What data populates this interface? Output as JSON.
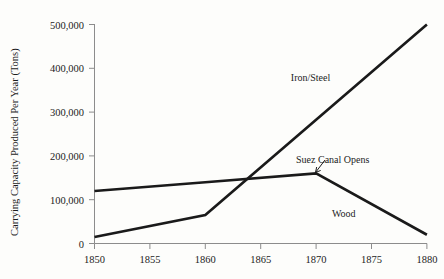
{
  "chart_data": {
    "type": "line",
    "title": "",
    "xlabel": "",
    "ylabel": "Carrying Capacity Produced Per Year (Tons)",
    "x": [
      1850,
      1855,
      1860,
      1865,
      1870,
      1875,
      1880
    ],
    "xlim": [
      1850,
      1880
    ],
    "ylim": [
      0,
      500000
    ],
    "grid": false,
    "legend_position": "inline-labels",
    "xticks": [
      "1850",
      "1855",
      "1860",
      "1865",
      "1870",
      "1875",
      "1880"
    ],
    "yticks": [
      "0",
      "100,000",
      "200,000",
      "300,000",
      "400,000",
      "500,000"
    ],
    "ytick_values": [
      0,
      100000,
      200000,
      300000,
      400000,
      500000
    ],
    "series": [
      {
        "name": "Wood",
        "x": [
          1850,
          1860,
          1870,
          1880
        ],
        "values": [
          120000,
          140000,
          160000,
          20000
        ],
        "color": "#1a1a1a"
      },
      {
        "name": "Iron/Steel",
        "x": [
          1850,
          1860,
          1880
        ],
        "values": [
          15000,
          65000,
          500000
        ],
        "color": "#1a1a1a"
      }
    ],
    "annotations": [
      {
        "text": "Iron/Steel",
        "x": 1869.5,
        "y": 370000,
        "kind": "series-label"
      },
      {
        "text": "Wood",
        "x": 1872.5,
        "y": 60000,
        "kind": "series-label"
      },
      {
        "text": "Suez Canal Opens",
        "x": 1871.5,
        "y": 183000,
        "kind": "callout",
        "points_to": {
          "x": 1870,
          "y": 160000
        }
      }
    ]
  },
  "axes": {
    "y_axis_title": "Carrying Capacity Produced Per Year (Tons)"
  }
}
